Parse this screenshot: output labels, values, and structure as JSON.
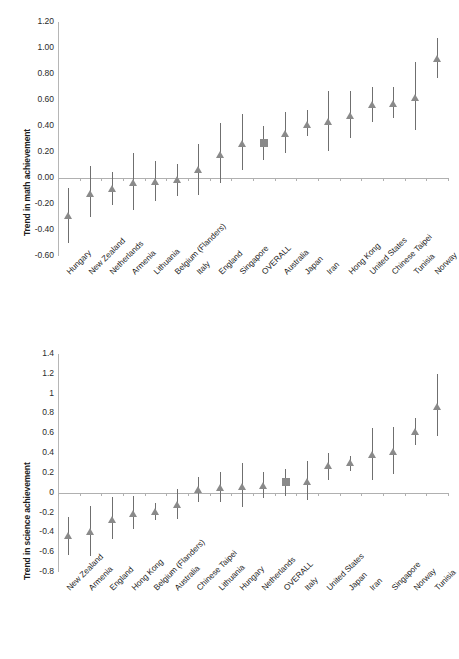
{
  "figure": {
    "background": "#ffffff",
    "marker_color": "#8a8a8a",
    "error_bar_color": "#6f6f6f",
    "axis_color": "#b0b0b0"
  },
  "chart_data": [
    {
      "id": "math",
      "type": "scatter",
      "title": "",
      "xlabel": "",
      "ylabel": "Trend in math achievement",
      "ylim": [
        -0.6,
        1.2
      ],
      "ytick_step": 0.2,
      "ytick_labels": [
        "1.20",
        "1.00",
        "0.80",
        "0.60",
        "0.40",
        "0.20",
        "0.00",
        "-0.20",
        "-0.40",
        "-0.60"
      ],
      "ytick_values": [
        1.2,
        1.0,
        0.8,
        0.6,
        0.4,
        0.2,
        0.0,
        -0.2,
        -0.4,
        -0.6
      ],
      "grid": false,
      "legend": "none",
      "zero_reference_line": 0.0,
      "categories": [
        "Hungary",
        "New Zealand",
        "Netherlands",
        "Armenia",
        "Lithuania",
        "Belgium (Flanders)",
        "Italy",
        "England",
        "Singapore",
        "OVERALL",
        "Australia",
        "Japan",
        "Iran",
        "Hong Kong",
        "United States",
        "Chinese Taipei",
        "Tunisia",
        "Norway"
      ],
      "values": [
        -0.29,
        -0.12,
        -0.08,
        -0.04,
        -0.03,
        -0.01,
        0.06,
        0.18,
        0.26,
        0.27,
        0.34,
        0.41,
        0.43,
        0.48,
        0.56,
        0.57,
        0.62,
        0.92
      ],
      "ci_low": [
        -0.5,
        -0.3,
        -0.21,
        -0.25,
        -0.18,
        -0.14,
        -0.13,
        -0.04,
        0.06,
        0.14,
        0.19,
        0.32,
        0.21,
        0.31,
        0.43,
        0.46,
        0.37,
        0.77
      ],
      "ci_high": [
        -0.08,
        0.09,
        0.05,
        0.19,
        0.13,
        0.11,
        0.26,
        0.42,
        0.49,
        0.4,
        0.51,
        0.52,
        0.67,
        0.67,
        0.7,
        0.7,
        0.89,
        1.08
      ],
      "marker_shapes": [
        "triangle",
        "triangle",
        "triangle",
        "triangle",
        "triangle",
        "triangle",
        "triangle",
        "triangle",
        "triangle",
        "square",
        "triangle",
        "triangle",
        "triangle",
        "triangle",
        "triangle",
        "triangle",
        "triangle",
        "triangle"
      ]
    },
    {
      "id": "science",
      "type": "scatter",
      "title": "",
      "xlabel": "",
      "ylabel": "Trend in science achievement",
      "ylim": [
        -0.8,
        1.4
      ],
      "ytick_step": 0.2,
      "ytick_labels": [
        "1.4",
        "1.2",
        "1",
        "0.8",
        "0.6",
        "0.4",
        "0.2",
        "0",
        "-0.2",
        "-0.4",
        "-0.6",
        "-0.8"
      ],
      "ytick_values": [
        1.4,
        1.2,
        1.0,
        0.8,
        0.6,
        0.4,
        0.2,
        0.0,
        -0.2,
        -0.4,
        -0.6,
        -0.8
      ],
      "grid": false,
      "legend": "none",
      "zero_reference_line": 0.0,
      "categories": [
        "New Zealand",
        "Armenia",
        "England",
        "Hong Kong",
        "Belgium (Flanders)",
        "Australia",
        "Chinese Taipei",
        "Lithuania",
        "Hungary",
        "Netherlands",
        "OVERALL",
        "Italy",
        "United States",
        "Japan",
        "Iran",
        "Singapore",
        "Norway",
        "Tunisia"
      ],
      "values": [
        -0.43,
        -0.39,
        -0.27,
        -0.21,
        -0.19,
        -0.12,
        0.03,
        0.05,
        0.06,
        0.07,
        0.11,
        0.11,
        0.27,
        0.3,
        0.38,
        0.41,
        0.61,
        0.87
      ],
      "ci_low": [
        -0.63,
        -0.64,
        -0.47,
        -0.37,
        -0.28,
        -0.27,
        -0.09,
        -0.09,
        -0.14,
        -0.05,
        -0.03,
        -0.07,
        0.13,
        0.22,
        0.13,
        0.19,
        0.48,
        0.57
      ],
      "ci_high": [
        -0.24,
        -0.13,
        -0.04,
        -0.03,
        -0.1,
        0.04,
        0.16,
        0.21,
        0.3,
        0.21,
        0.24,
        0.32,
        0.4,
        0.37,
        0.65,
        0.66,
        0.75,
        1.2
      ],
      "marker_shapes": [
        "triangle",
        "triangle",
        "triangle",
        "triangle",
        "triangle",
        "triangle",
        "triangle",
        "triangle",
        "triangle",
        "triangle",
        "square",
        "triangle",
        "triangle",
        "triangle",
        "triangle",
        "triangle",
        "triangle",
        "triangle"
      ]
    }
  ]
}
